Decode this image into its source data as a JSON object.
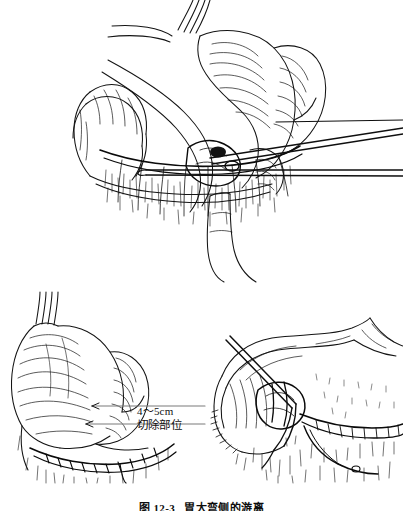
{
  "document": {
    "type": "medical-textbook-illustration",
    "subject": "gastric surgery — mobilization of the greater curvature of the stomach",
    "background_color": "#ffffff",
    "ink_color": "#111111",
    "panel_count": 3
  },
  "figures": [
    {
      "id": "fig-top",
      "name": "main-operative-view",
      "description": "Stomach, esophagus and transverse colon exposed; surgical clamps and forceps retract the greater omentum along the gastrocolic ligament",
      "instrument_count": 3
    },
    {
      "id": "fig-bottom-left",
      "name": "resection-extent-diagram",
      "description": "Stomach with greater curvature and omentum showing the measured margin and the planned resection line"
    },
    {
      "id": "fig-bottom-right",
      "name": "vessel-ligation-detail",
      "description": "Close-up of the gastroepiploic vascular arcade being ligated and divided with a needle holder"
    }
  ],
  "labels": {
    "length": "4～5cm",
    "resection_site": "切除部位"
  },
  "caption": {
    "number": "图 12-3",
    "title": "胃大弯侧的游离"
  },
  "leader_lines": [
    {
      "name": "leader-line-length",
      "points_to": "labels.length"
    },
    {
      "name": "leader-line-resection-site",
      "points_to": "labels.resection_site"
    }
  ]
}
